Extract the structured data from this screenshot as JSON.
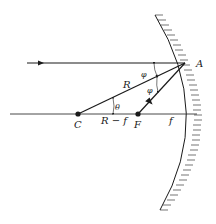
{
  "diagram": {
    "type": "concave-mirror-ray-diagram",
    "colors": {
      "ink": "#1a1a1a",
      "background": "#ffffff"
    },
    "points": {
      "A": {
        "label": "A"
      },
      "C": {
        "label": "C"
      },
      "F": {
        "label": "F"
      }
    },
    "segments": {
      "radius": {
        "label": "R"
      },
      "center_to_focus": {
        "label": "R − f"
      },
      "focal_length": {
        "label": "f"
      }
    },
    "angles": {
      "incidence": {
        "label": "φ"
      },
      "reflection": {
        "label": "φ"
      },
      "center_angle": {
        "label": "θ"
      }
    }
  }
}
